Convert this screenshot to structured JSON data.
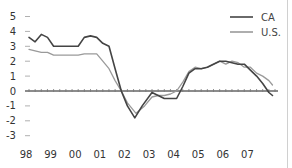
{
  "chart_data": {
    "type": "line",
    "title": "",
    "xlabel": "",
    "ylabel": "",
    "ylim": [
      -3,
      5
    ],
    "yticks": [
      "5",
      "4",
      "3",
      "2",
      "1",
      "0",
      "-1",
      "-2",
      "-3"
    ],
    "ytick_values": [
      5,
      4,
      3,
      2,
      1,
      0,
      -1,
      -2,
      -3
    ],
    "xticks": [
      "98",
      "99",
      "00",
      "01",
      "02",
      "03",
      "04",
      "05",
      "06",
      "07"
    ],
    "grid": false,
    "legend_position": "top-right",
    "series": [
      {
        "name": "CA",
        "color": "#444444",
        "points": [
          [
            1998.0,
            3.6
          ],
          [
            1998.25,
            3.3
          ],
          [
            1998.5,
            3.8
          ],
          [
            1998.75,
            3.6
          ],
          [
            1999.0,
            3.0
          ],
          [
            1999.5,
            3.0
          ],
          [
            1999.75,
            3.0
          ],
          [
            2000.0,
            3.0
          ],
          [
            2000.25,
            3.6
          ],
          [
            2000.5,
            3.7
          ],
          [
            2000.75,
            3.6
          ],
          [
            2001.0,
            3.2
          ],
          [
            2001.25,
            3.0
          ],
          [
            2001.5,
            1.5
          ],
          [
            2001.75,
            0.0
          ],
          [
            2002.0,
            -1.0
          ],
          [
            2002.3,
            -1.8
          ],
          [
            2002.6,
            -1.0
          ],
          [
            2003.0,
            -0.1
          ],
          [
            2003.25,
            -0.3
          ],
          [
            2003.5,
            -0.5
          ],
          [
            2003.75,
            -0.5
          ],
          [
            2004.0,
            -0.5
          ],
          [
            2004.25,
            0.3
          ],
          [
            2004.5,
            1.2
          ],
          [
            2004.75,
            1.5
          ],
          [
            2005.0,
            1.5
          ],
          [
            2005.25,
            1.6
          ],
          [
            2005.5,
            1.8
          ],
          [
            2005.75,
            2.0
          ],
          [
            2006.0,
            2.0
          ],
          [
            2006.25,
            1.9
          ],
          [
            2006.5,
            1.8
          ],
          [
            2006.75,
            1.8
          ],
          [
            2007.0,
            1.4
          ],
          [
            2007.25,
            1.0
          ],
          [
            2007.5,
            0.5
          ],
          [
            2007.75,
            -0.1
          ],
          [
            2007.9,
            -0.3
          ]
        ]
      },
      {
        "name": "U.S.",
        "color": "#9a9a9a",
        "points": [
          [
            1998.0,
            2.8
          ],
          [
            1998.25,
            2.7
          ],
          [
            1998.5,
            2.6
          ],
          [
            1998.75,
            2.6
          ],
          [
            1999.0,
            2.4
          ],
          [
            1999.5,
            2.4
          ],
          [
            2000.0,
            2.4
          ],
          [
            2000.25,
            2.5
          ],
          [
            2000.5,
            2.5
          ],
          [
            2000.75,
            2.5
          ],
          [
            2001.0,
            2.0
          ],
          [
            2001.25,
            1.5
          ],
          [
            2001.5,
            0.7
          ],
          [
            2001.75,
            0.0
          ],
          [
            2002.0,
            -0.8
          ],
          [
            2002.35,
            -1.5
          ],
          [
            2002.7,
            -1.0
          ],
          [
            2003.0,
            -0.4
          ],
          [
            2003.25,
            -0.3
          ],
          [
            2003.5,
            -0.3
          ],
          [
            2003.75,
            -0.2
          ],
          [
            2004.0,
            0.0
          ],
          [
            2004.25,
            0.6
          ],
          [
            2004.5,
            1.3
          ],
          [
            2004.75,
            1.6
          ],
          [
            2005.0,
            1.5
          ],
          [
            2005.25,
            1.6
          ],
          [
            2005.5,
            1.8
          ],
          [
            2005.75,
            2.0
          ],
          [
            2006.0,
            1.8
          ],
          [
            2006.25,
            2.0
          ],
          [
            2006.5,
            1.9
          ],
          [
            2006.75,
            1.6
          ],
          [
            2007.0,
            1.6
          ],
          [
            2007.25,
            1.2
          ],
          [
            2007.5,
            1.0
          ],
          [
            2007.75,
            0.7
          ],
          [
            2007.9,
            0.4
          ]
        ]
      }
    ]
  },
  "legend": {
    "items": [
      {
        "label": "CA",
        "color": "#444444"
      },
      {
        "label": "U.S.",
        "color": "#9a9a9a"
      }
    ]
  },
  "layout": {
    "x_origin_year": 1998,
    "x_origin_px": 29,
    "px_per_year": 24.6,
    "zero_y_px": 91,
    "px_per_unit": 14.9,
    "axis_x_start": 25,
    "axis_x_end": 278
  }
}
